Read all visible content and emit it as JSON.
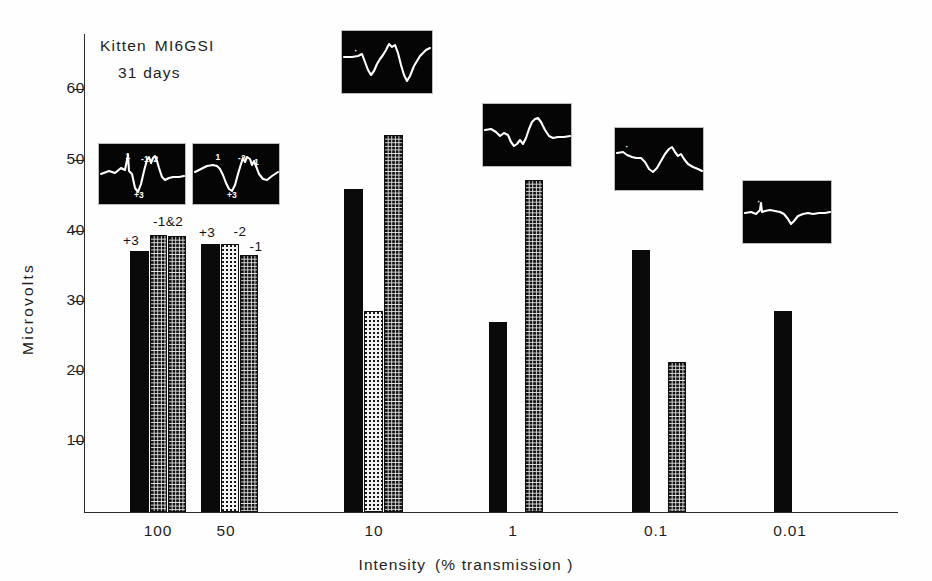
{
  "figure": {
    "caption_line1": "Kitten MI6GSI",
    "caption_line2": "31 days",
    "caption_word1": "Kitten",
    "caption_word2": "MI6GSI",
    "background_color": "#ffffff",
    "ink_color": "#1a1a1a"
  },
  "axes": {
    "y_title": "Microvolts",
    "y_ticks": [
      "60",
      "50",
      "40",
      "30",
      "20",
      "10"
    ],
    "y_tick_values": [
      60,
      50,
      40,
      30,
      20,
      10
    ],
    "x_title_part1": "Intensity",
    "x_title_part2": "(% transmission )",
    "x_ticks": [
      "100",
      "50",
      "10",
      "1",
      "0.1",
      "0.01"
    ]
  },
  "chart_data": {
    "type": "bar",
    "xlabel": "Intensity (% transmission )",
    "ylabel": "Microvolts",
    "ylim": [
      0,
      66
    ],
    "grid": false,
    "legend_position": "none",
    "categories": [
      "100",
      "50",
      "10",
      "1",
      "0.1",
      "0.01"
    ],
    "series": [
      {
        "name": "component +3",
        "fill": "solid-black",
        "color": "#0a0a0a",
        "values": [
          37.0,
          38.0,
          45.8,
          27.0,
          37.2,
          28.5
        ]
      },
      {
        "name": "component -1",
        "fill": "light-stipple",
        "color": "#f2f2f2",
        "values": [
          39.3,
          38.0,
          28.5,
          null,
          null,
          null
        ]
      },
      {
        "name": "component -2",
        "fill": "dark-stipple",
        "color": "#e4e4e4",
        "values": [
          39.2,
          36.5,
          53.5,
          47.1,
          21.3,
          null
        ]
      }
    ],
    "bar_annotations": [
      {
        "category": "100",
        "label": "+3",
        "series": "component +3"
      },
      {
        "category": "100",
        "label": "-1&2",
        "series": "component -1/-2"
      },
      {
        "category": "50",
        "label": "+3",
        "series": "component +3"
      },
      {
        "category": "50",
        "label": "-2",
        "series": "component -1"
      },
      {
        "category": "50",
        "label": "-1",
        "series": "component -2"
      }
    ]
  },
  "bars": [
    {
      "id": "bar-100-p3",
      "group": "100",
      "series": "component +3",
      "value": 37.0,
      "fill": "solid",
      "x": 130,
      "width": 19
    },
    {
      "id": "bar-100-n1",
      "group": "100",
      "series": "component -1",
      "value": 39.3,
      "fill": "dot-dark",
      "x": 150,
      "width": 17
    },
    {
      "id": "bar-100-n2",
      "group": "100",
      "series": "component -2",
      "value": 39.2,
      "fill": "dot-dark",
      "x": 168,
      "width": 18
    },
    {
      "id": "bar-50-p3",
      "group": "50",
      "series": "component +3",
      "value": 38.0,
      "fill": "solid",
      "x": 201,
      "width": 19
    },
    {
      "id": "bar-50-n2",
      "group": "50",
      "series": "component -1",
      "value": 38.0,
      "fill": "dot-light",
      "x": 221,
      "width": 18
    },
    {
      "id": "bar-50-n1",
      "group": "50",
      "series": "component -2",
      "value": 36.5,
      "fill": "dot-dark",
      "x": 240,
      "width": 18
    },
    {
      "id": "bar-10-p3",
      "group": "10",
      "series": "component +3",
      "value": 45.8,
      "fill": "solid",
      "x": 344,
      "width": 19
    },
    {
      "id": "bar-10-n1",
      "group": "10",
      "series": "component -1",
      "value": 28.5,
      "fill": "dot-light",
      "x": 364,
      "width": 19
    },
    {
      "id": "bar-10-n2",
      "group": "10",
      "series": "component -2",
      "value": 53.5,
      "fill": "dot-dark",
      "x": 384,
      "width": 19
    },
    {
      "id": "bar-1-p3",
      "group": "1",
      "series": "component +3",
      "value": 27.0,
      "fill": "solid",
      "x": 489,
      "width": 18
    },
    {
      "id": "bar-1-n2",
      "group": "1",
      "series": "component -2",
      "value": 47.1,
      "fill": "dot-dark",
      "x": 525,
      "width": 18
    },
    {
      "id": "bar-01-p3",
      "group": "0.1",
      "series": "component +3",
      "value": 37.2,
      "fill": "solid",
      "x": 632,
      "width": 18
    },
    {
      "id": "bar-01-n2",
      "group": "0.1",
      "series": "component -2",
      "value": 21.3,
      "fill": "dot-dark",
      "x": 668,
      "width": 18
    },
    {
      "id": "bar-001-p3",
      "group": "0.01",
      "series": "component +3",
      "value": 28.5,
      "fill": "solid",
      "x": 774,
      "width": 18
    }
  ],
  "bar_annotation_placements": [
    {
      "id": "annot-100-p3",
      "label": "+3",
      "x": 131,
      "y": 233
    },
    {
      "id": "annot-100-n12",
      "label": "-1&2",
      "x": 168,
      "y": 214
    },
    {
      "id": "annot-50-p3",
      "label": "+3",
      "x": 207,
      "y": 225
    },
    {
      "id": "annot-50-n2",
      "label": "-2",
      "x": 240,
      "y": 224
    },
    {
      "id": "annot-50-n1",
      "label": "-1",
      "x": 256,
      "y": 239
    }
  ],
  "insets": [
    {
      "id": "inset-100",
      "group": "100",
      "x": 98,
      "y": 143,
      "width": 86,
      "height": 60,
      "trace": "M2,30 L10,27 L16,29 L22,24 L26,26 L29,11 L30,27 L33,30 L36,44 L39,48 L42,40 L45,27 L48,16 L50,13 L52,19 L54,14 L56,12 L58,17 L60,24 L63,33 L66,36 L70,34 L74,33 L80,33 L85,32",
      "labels": [
        {
          "text": "1",
          "x": 29,
          "y": 7
        },
        {
          "text": "-1",
          "x": 46,
          "y": 10
        },
        {
          "text": "2",
          "x": 57,
          "y": 10
        },
        {
          "text": "+3",
          "x": 40,
          "y": 46
        }
      ]
    },
    {
      "id": "inset-50",
      "group": "50",
      "x": 192,
      "y": 143,
      "width": 86,
      "height": 60,
      "trace": "M2,28 L8,25 L14,22 L20,21 L24,22 L27,25 L30,31 L33,39 L36,45 L39,47 L42,41 L45,30 L48,20 L50,14 L52,18 L54,13 L57,15 L59,21 L61,17 L63,22 L66,30 L70,35 L74,36 L79,32 L85,28",
      "labels": [
        {
          "text": "1",
          "x": 25,
          "y": 8
        },
        {
          "text": "-2",
          "x": 49,
          "y": 9
        },
        {
          "text": "-1",
          "x": 62,
          "y": 13
        },
        {
          "text": "+3",
          "x": 39,
          "y": 46
        }
      ]
    },
    {
      "id": "inset-10",
      "group": "10",
      "x": 341,
      "y": 30,
      "width": 90,
      "height": 62,
      "trace": "M2,26 L10,26 L16,25 L20,23 L23,31 L26,39 L29,44 L32,40 L35,33 L38,28 L41,24 L44,19 L47,13 L50,16 L53,14 L56,22 L59,34 L62,44 L65,50 L68,45 L72,35 L78,25 L84,19 L88,17",
      "labels": [
        {
          "text": "·",
          "x": 14,
          "y": 15
        }
      ]
    },
    {
      "id": "inset-1",
      "group": "1",
      "x": 482,
      "y": 103,
      "width": 88,
      "height": 62,
      "trace": "M2,26 L8,25 L13,28 L17,32 L21,29 L25,31 L28,38 L31,42 L34,40 L37,36 L40,40 L43,34 L46,25 L49,18 L52,15 L55,14 L58,18 L62,26 L66,32 L70,34 L75,33 L81,33 L87,32",
      "labels": []
    },
    {
      "id": "inset-01",
      "group": "0.1",
      "x": 614,
      "y": 127,
      "width": 88,
      "height": 62,
      "trace": "M2,25 L8,24 L12,27 L17,29 L21,30 L26,30 L30,34 L34,41 L38,44 L42,40 L46,33 L50,26 L54,21 L57,19 L60,24 L63,28 L66,26 L69,31 L73,36 L78,39 L83,41 L87,43",
      "labels": [
        {
          "text": "·",
          "x": 12,
          "y": 14
        }
      ]
    },
    {
      "id": "inset-001",
      "group": "0.01",
      "x": 742,
      "y": 180,
      "width": 88,
      "height": 62,
      "trace": "M2,32 L8,31 L13,33 L17,29 L18,22 L19,31 L22,30 L27,29 L32,30 L37,31 L41,33 L45,38 L48,43 L51,40 L55,35 L60,33 L65,32 L70,33 L76,32 L82,32 L87,31",
      "labels": [
        {
          "text": "·",
          "x": 16,
          "y": 16
        }
      ]
    }
  ],
  "geometry": {
    "baseline_y": 512,
    "pixels_per_microvolt": 7.05,
    "y_tick_pixel_positions": [
      89,
      160,
      231,
      301,
      371,
      441
    ],
    "x_tick_pixel_positions": [
      158,
      226,
      374,
      513,
      656,
      790
    ]
  }
}
